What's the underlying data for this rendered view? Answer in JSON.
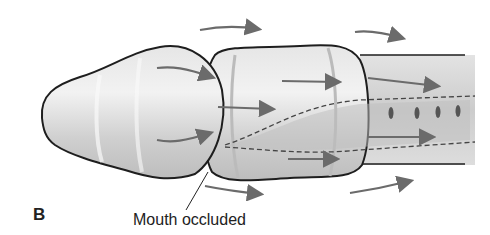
{
  "figure": {
    "panel_label": "B",
    "annotation": "Mouth occluded",
    "colors": {
      "outline": "#1e1e1e",
      "body_fill": "#d9d9d9",
      "highlight": "#f0f0f0",
      "shadow": "#b5b5b5",
      "arrow": "#6b6b6b",
      "dashed": "#444444"
    }
  }
}
